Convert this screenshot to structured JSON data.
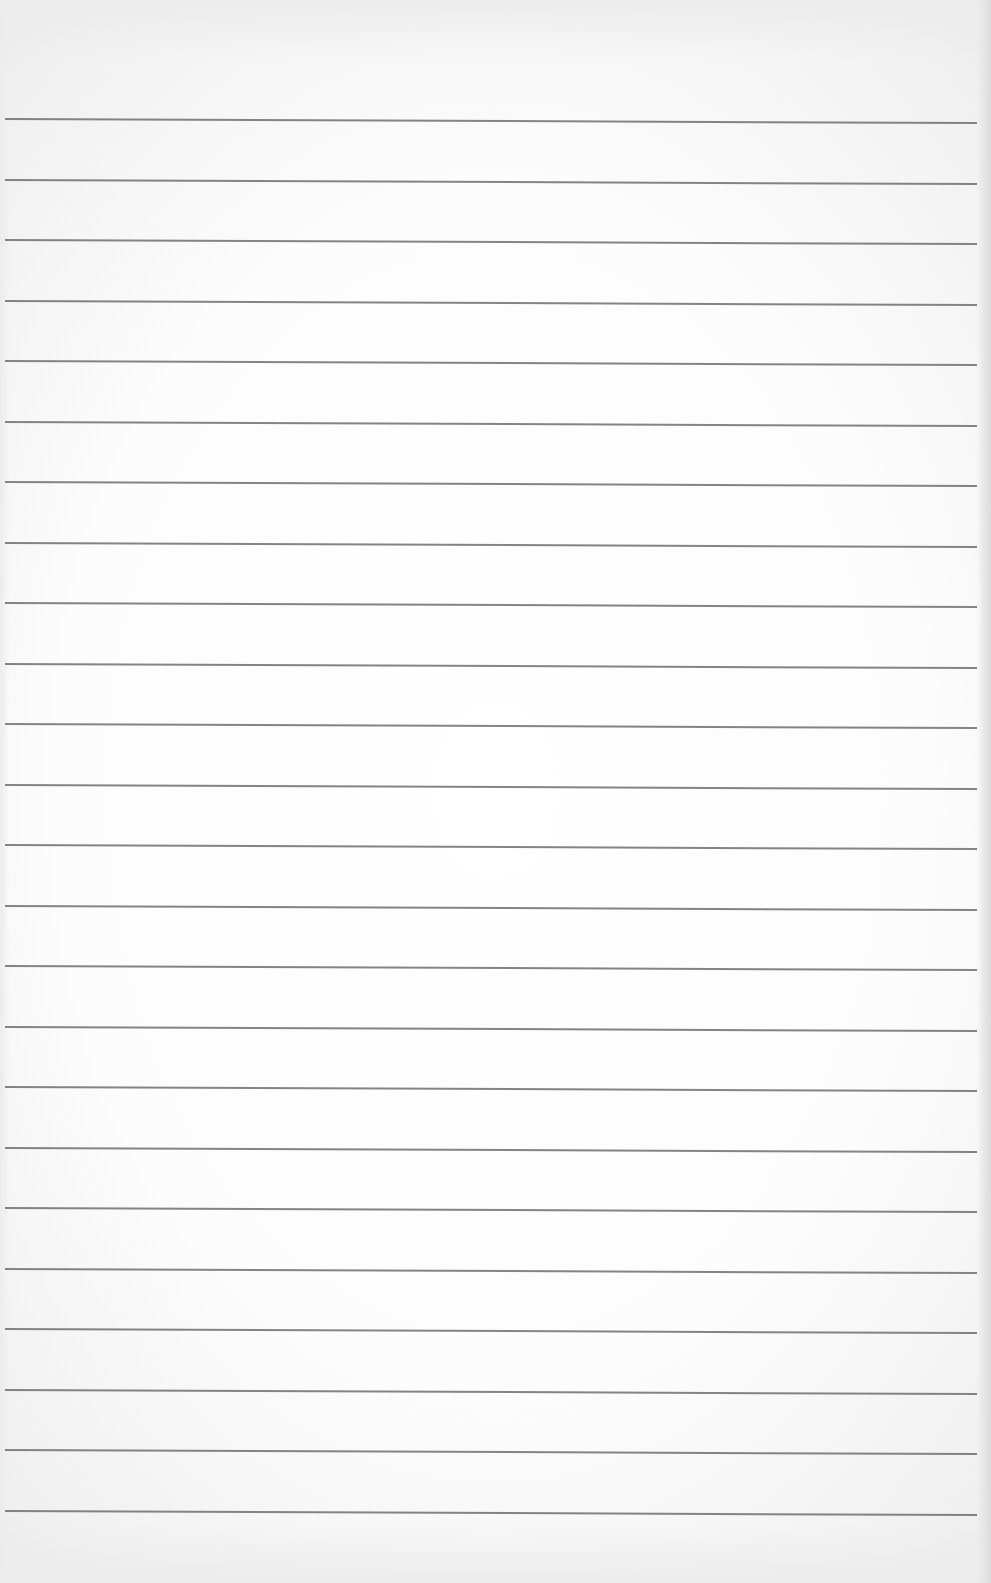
{
  "page": {
    "type": "lined-paper",
    "content_text": "",
    "has_margin_line": false
  },
  "rules": {
    "count": 24,
    "first_y": 118,
    "spacing": 60.5,
    "left_x": 5,
    "width": 972,
    "slope_deg": 0.24,
    "color": "#6f6f6f"
  },
  "colors": {
    "paper": "#ffffff",
    "paper_edge": "#e9e9e9",
    "rule": "#6f6f6f"
  }
}
